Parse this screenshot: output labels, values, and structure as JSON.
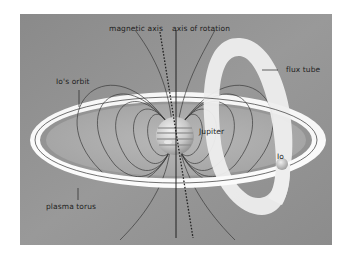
{
  "diagram": {
    "colors": {
      "panel_background": "#8f8f8f",
      "panel_light": "#a9a9a9",
      "torus": "#fafafa",
      "flux_tube": "#efefef",
      "field_lines": "#3a3a3a",
      "jupiter": "#c9c9c9",
      "text": "#1e1e1e"
    },
    "labels": {
      "magnetic_axis": "magnetic axis",
      "axis_of_rotation": "axis of rotation",
      "ios_orbit": "Io's orbit",
      "flux_tube": "flux tube",
      "jupiter": "Jupiter",
      "io": "Io",
      "plasma_torus": "plasma torus"
    },
    "elements": [
      {
        "id": "jupiter",
        "type": "planet"
      },
      {
        "id": "io",
        "type": "moon"
      },
      {
        "id": "plasma-torus",
        "type": "ring"
      },
      {
        "id": "ios-orbit",
        "type": "orbit-line"
      },
      {
        "id": "flux-tube",
        "type": "tube-loop"
      },
      {
        "id": "magnetic-axis",
        "type": "dashed-axis"
      },
      {
        "id": "axis-of-rotation",
        "type": "solid-axis"
      },
      {
        "id": "magnetic-field-lines",
        "type": "dipole-field-lines"
      }
    ]
  }
}
